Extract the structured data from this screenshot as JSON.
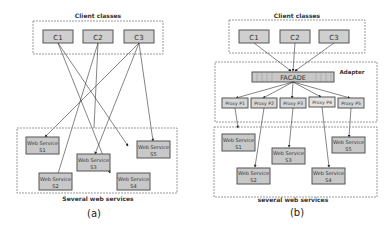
{
  "diagram_a": {
    "caption": "(a)",
    "top_group_label": "Client classes",
    "bottom_group_label": "Several web services",
    "clients": [
      "C1",
      "C2",
      "C3"
    ],
    "services": [
      {
        "line1": "Web Service",
        "line2": "S1"
      },
      {
        "line1": "Web Service",
        "line2": "S2"
      },
      {
        "line1": "Web Service",
        "line2": "S3"
      },
      {
        "line1": "Web Service",
        "line2": "S4"
      },
      {
        "line1": "Web Service",
        "line2": "S5"
      }
    ]
  },
  "diagram_b": {
    "caption": "(b)",
    "top_group_label": "Client classes",
    "adapter_label": "Adapter",
    "facade_label": "FACADE",
    "bottom_group_label": "several web services",
    "clients": [
      "C1",
      "C2",
      "C3"
    ],
    "proxies": [
      "Proxy P1",
      "Proxy P2",
      "Proxy P3",
      "Proxy P4",
      "Proxy P5"
    ],
    "services": [
      {
        "line1": "Web Service",
        "line2": "S1"
      },
      {
        "line1": "Web Service",
        "line2": "S2"
      },
      {
        "line1": "Web Service",
        "line2": "S3"
      },
      {
        "line1": "Web Service",
        "line2": "S4"
      },
      {
        "line1": "Web Service",
        "line2": "S5"
      }
    ]
  },
  "colors": {
    "box_fill": "#c8c8c8",
    "box_stroke": "#555555",
    "group_stroke": "#999999",
    "line": "#333333"
  }
}
